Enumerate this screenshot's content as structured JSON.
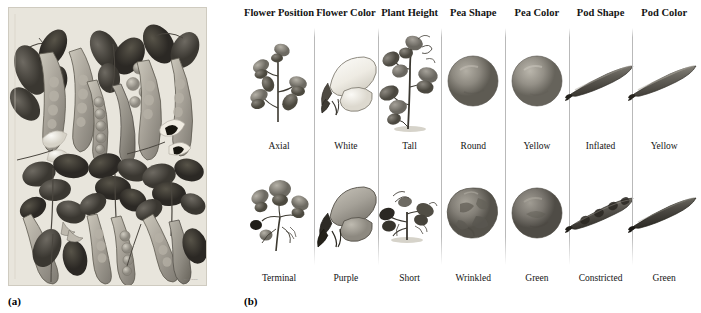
{
  "panels": {
    "a": {
      "tag": "(a)",
      "plate_title": "BARON BOTANY",
      "plate_subtitle": "TAB. XXIII",
      "plate_number": "pl. 23",
      "plate_signature": "del. et sculp."
    },
    "b": {
      "tag": "(b)"
    }
  },
  "traits": [
    {
      "header": "Flower Position",
      "icon_top": "axial-flower-icon",
      "label_top": "Axial",
      "icon_bottom": "terminal-flower-icon",
      "label_bottom": "Terminal"
    },
    {
      "header": "Flower Color",
      "icon_top": "white-flower-icon",
      "label_top": "White",
      "icon_bottom": "purple-flower-icon",
      "label_bottom": "Purple"
    },
    {
      "header": "Plant Height",
      "icon_top": "tall-plant-icon",
      "label_top": "Tall",
      "icon_bottom": "short-plant-icon",
      "label_bottom": "Short"
    },
    {
      "header": "Pea Shape",
      "icon_top": "round-pea-icon",
      "label_top": "Round",
      "icon_bottom": "wrinkled-pea-icon",
      "label_bottom": "Wrinkled"
    },
    {
      "header": "Pea Color",
      "icon_top": "yellow-pea-icon",
      "label_top": "Yellow",
      "icon_bottom": "green-pea-icon",
      "label_bottom": "Green"
    },
    {
      "header": "Pod Shape",
      "icon_top": "inflated-pod-icon",
      "label_top": "Inflated",
      "icon_bottom": "constricted-pod-icon",
      "label_bottom": "Constricted"
    },
    {
      "header": "Pod Color",
      "icon_top": "yellow-pod-icon",
      "label_top": "Yellow",
      "icon_bottom": "green-pod-icon",
      "label_bottom": "Green"
    }
  ],
  "colors": {
    "page_background": "#ffffff",
    "plate_background": "#e8e5dc",
    "divider": "#b9b9b9",
    "text": "#141414"
  }
}
